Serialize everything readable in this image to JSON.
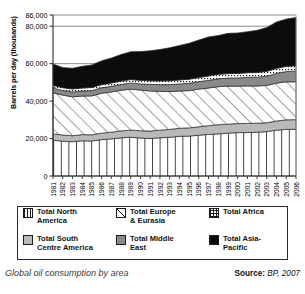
{
  "figure": {
    "caption": "Global oil consumption by area",
    "source_label": "Source:",
    "source_value": "BP, 2007"
  },
  "legend": {
    "items": [
      {
        "label_line1": "Total North",
        "label_line2": "America",
        "swatch": "vertical-lines-swatch",
        "color": "#ffffff"
      },
      {
        "label_line1": "Total Europe",
        "label_line2": "& Eurasia",
        "swatch": "diagonal-hatch-swatch",
        "color": "#ffffff"
      },
      {
        "label_line1": "Total Africa",
        "label_line2": "",
        "swatch": "dotted-grid-swatch",
        "color": "#ffffff"
      },
      {
        "label_line1": "Total South",
        "label_line2": "Centre America",
        "swatch": "light-gray-swatch",
        "color": "#b9b9b9"
      },
      {
        "label_line1": "Total Middle",
        "label_line2": "East",
        "swatch": "mid-gray-swatch",
        "color": "#8a8a8a"
      },
      {
        "label_line1": "Total Asia-",
        "label_line2": "Pacific",
        "swatch": "black-swatch",
        "color": "#0c0c0c"
      }
    ]
  },
  "chart_data": {
    "type": "area",
    "stacked": true,
    "title": "Global oil consumption by area",
    "xlabel": "",
    "ylabel": "Barrels per day (thousands)",
    "ylim": [
      0,
      86000
    ],
    "yticks": [
      0,
      20000,
      40000,
      60000,
      80000,
      86000
    ],
    "ytick_labels": [
      "0",
      "20,000",
      "40,000",
      "60,000",
      "80,000",
      "86,000"
    ],
    "grid": true,
    "legend_position": "below-plot",
    "categories": [
      "1981",
      "1982",
      "1983",
      "1984",
      "1985",
      "1986",
      "1987",
      "1988",
      "1989",
      "1990",
      "1991",
      "1992",
      "1993",
      "1994",
      "1995",
      "1996",
      "1997",
      "1998",
      "1999",
      "2000",
      "2001",
      "2002",
      "2003",
      "2004",
      "2005",
      "2006"
    ],
    "series": [
      {
        "name": "Total North America",
        "key": "north_america",
        "fill": "vertical-lines",
        "values": [
          19100,
          18600,
          18300,
          18800,
          18700,
          19400,
          19800,
          20400,
          20700,
          20300,
          20000,
          20400,
          20700,
          21200,
          21300,
          21800,
          22200,
          22500,
          22900,
          23200,
          23200,
          23400,
          23700,
          24500,
          24900,
          24900
        ]
      },
      {
        "name": "Total South Centre America",
        "key": "south_centre_america",
        "fill": "light-gray",
        "values": [
          3400,
          3300,
          3200,
          3300,
          3300,
          3500,
          3600,
          3700,
          3800,
          3900,
          4000,
          4100,
          4200,
          4300,
          4400,
          4500,
          4700,
          4900,
          4800,
          4800,
          4900,
          4800,
          4700,
          4900,
          5100,
          5200
        ]
      },
      {
        "name": "Total Europe & Eurasia",
        "key": "europe_eurasia",
        "fill": "diagonal-hatch",
        "values": [
          22000,
          21300,
          20800,
          20600,
          20800,
          21300,
          21500,
          21700,
          21900,
          21700,
          21400,
          20700,
          20200,
          19900,
          19900,
          20100,
          20100,
          20300,
          20300,
          20000,
          20000,
          19900,
          20000,
          20200,
          20300,
          20200
        ]
      },
      {
        "name": "Total Middle East",
        "key": "middle_east",
        "fill": "mid-gray",
        "values": [
          2400,
          2500,
          2600,
          2700,
          2800,
          2900,
          3000,
          3100,
          3200,
          3300,
          3500,
          3600,
          3700,
          3800,
          3900,
          4000,
          4100,
          4200,
          4300,
          4400,
          4600,
          4700,
          4900,
          5200,
          5500,
          5700
        ]
      },
      {
        "name": "Total Africa",
        "key": "africa",
        "fill": "dotted-grid",
        "values": [
          1500,
          1500,
          1600,
          1600,
          1700,
          1700,
          1800,
          1800,
          1900,
          1900,
          2000,
          2000,
          2100,
          2100,
          2200,
          2200,
          2300,
          2400,
          2400,
          2400,
          2500,
          2500,
          2600,
          2700,
          2800,
          2900
        ]
      },
      {
        "name": "Total Asia-Pacific",
        "key": "asia_pacific",
        "fill": "black",
        "values": [
          11400,
          10700,
          11000,
          11600,
          12000,
          12700,
          13300,
          14200,
          14900,
          15400,
          16000,
          16800,
          17600,
          18400,
          19200,
          20000,
          20900,
          20700,
          21500,
          21600,
          21900,
          22500,
          23400,
          24800,
          25200,
          25700
        ]
      }
    ]
  }
}
